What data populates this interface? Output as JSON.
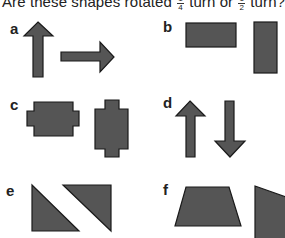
{
  "title": {
    "prefix": "Are these shapes rotated",
    "frac1_num": "1",
    "frac1_den": "4",
    "middle": "turn or",
    "frac2_num": "1",
    "frac2_den": "2",
    "suffix": "turn?"
  },
  "items": [
    {
      "label": "a",
      "shapes": [
        "arrow-up",
        "arrow-right"
      ]
    },
    {
      "label": "b",
      "shapes": [
        "rectangle-horizontal",
        "rectangle-vertical"
      ]
    },
    {
      "label": "c",
      "shapes": [
        "notched-rect-horizontal",
        "notched-rect-vertical"
      ]
    },
    {
      "label": "d",
      "shapes": [
        "arrow-up",
        "arrow-down"
      ]
    },
    {
      "label": "e",
      "shapes": [
        "right-triangle",
        "right-triangle-rotated"
      ]
    },
    {
      "label": "f",
      "shapes": [
        "trapezoid",
        "trapezoid-rotated"
      ]
    }
  ],
  "colors": {
    "shape_fill": "#555555",
    "shape_stroke": "#1a1a1a"
  }
}
